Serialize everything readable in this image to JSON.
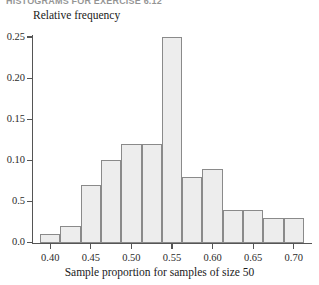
{
  "figure": {
    "running_head": "HISTOGRAMS FOR EXERCISE 6.12",
    "y_axis_title": "Relative frequency",
    "x_axis_title": "Sample proportion for samples of size 50"
  },
  "chart_data": {
    "type": "bar",
    "title": "",
    "subtitle": "",
    "xlabel": "Sample proportion for samples of size 50",
    "ylabel": "Relative frequency",
    "grid": false,
    "legend": null,
    "bin_width": 0.025,
    "bin_starts": [
      0.3875,
      0.4125,
      0.4375,
      0.4625,
      0.4875,
      0.5125,
      0.5375,
      0.5625,
      0.5875,
      0.6125,
      0.6375,
      0.6625,
      0.6875
    ],
    "categories": [
      "0.3875-0.4125",
      "0.4125-0.4375",
      "0.4375-0.4625",
      "0.4625-0.4875",
      "0.4875-0.5125",
      "0.5125-0.5375",
      "0.5375-0.5625",
      "0.5625-0.5875",
      "0.5875-0.6125",
      "0.6125-0.6375",
      "0.6375-0.6625",
      "0.6625-0.6875",
      "0.6875-0.7125"
    ],
    "values": [
      0.01,
      0.02,
      0.07,
      0.1,
      0.12,
      0.12,
      0.25,
      0.08,
      0.09,
      0.04,
      0.04,
      0.03,
      0.03
    ],
    "xlim": [
      0.3775,
      0.7225
    ],
    "ylim": [
      0.0,
      0.26
    ],
    "x_ticks": [
      0.4,
      0.45,
      0.5,
      0.55,
      0.6,
      0.65,
      0.7
    ],
    "x_tick_labels": [
      "0.40",
      "0.45",
      "0.50",
      "0.55",
      "0.60",
      "0.65",
      "0.70"
    ],
    "y_ticks": [
      0.0,
      0.05,
      0.1,
      0.15,
      0.2,
      0.25
    ],
    "y_tick_labels": [
      "0.0",
      "0.5",
      "0.10",
      "0.15",
      "0.20",
      "0.25"
    ]
  },
  "style": {
    "bar_fill": "#ededed",
    "bar_stroke": "#8a8a8a",
    "axis_color": "#555555",
    "text_color": "#1a1a1a"
  }
}
